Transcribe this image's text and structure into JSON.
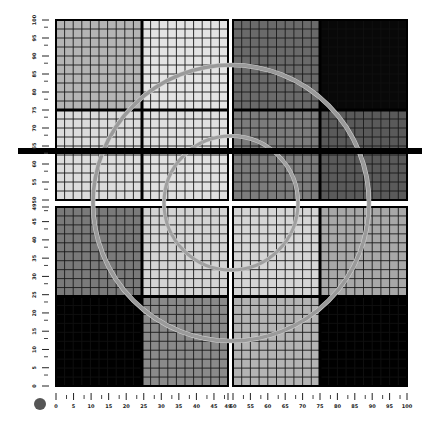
{
  "target": {
    "title": "",
    "plate": {
      "x0": 56,
      "y0": 20,
      "x1": 407,
      "y1": 386,
      "gap_x": [
        228,
        233
      ],
      "gap_y": [
        200,
        207
      ]
    },
    "quadrants": [
      {
        "name": "top-left",
        "cells": [
          {
            "name": "tl-a",
            "fill": "#b4b4b4"
          },
          {
            "name": "tl-b",
            "fill": "#e4e4e4"
          },
          {
            "name": "tl-c",
            "fill": "#dcdcdc"
          },
          {
            "name": "tl-d",
            "fill": "#e0e0e0"
          }
        ]
      },
      {
        "name": "top-right",
        "cells": [
          {
            "name": "tr-a",
            "fill": "#6a6a6a"
          },
          {
            "name": "tr-b",
            "fill": "#080808"
          },
          {
            "name": "tr-c",
            "fill": "#7c7c7c"
          },
          {
            "name": "tr-d",
            "fill": "#5a5a5a"
          }
        ]
      },
      {
        "name": "bottom-left",
        "cells": [
          {
            "name": "bl-a",
            "fill": "#7a7a7a"
          },
          {
            "name": "bl-b",
            "fill": "#d4d4d4"
          },
          {
            "name": "bl-c",
            "fill": "#000000"
          },
          {
            "name": "bl-d",
            "fill": "#8a8a8a"
          }
        ]
      },
      {
        "name": "bottom-right",
        "cells": [
          {
            "name": "br-a",
            "fill": "#d6d6d6"
          },
          {
            "name": "br-b",
            "fill": "#a8a8a8"
          },
          {
            "name": "br-c",
            "fill": "#b4b4b4"
          },
          {
            "name": "br-d",
            "fill": "#000000"
          }
        ]
      }
    ],
    "circles": [
      {
        "name": "outer-ring",
        "cx": 231,
        "cy": 203,
        "r": 138,
        "stroke": "#9a9a9a",
        "width": 3.5
      },
      {
        "name": "inner-ring",
        "cx": 231,
        "cy": 203,
        "r": 67,
        "stroke": "#a0a0a0",
        "width": 3
      }
    ],
    "bar": {
      "x0": 18,
      "x1": 422,
      "y": 151,
      "h": 6,
      "fill": "#000000"
    },
    "dot": {
      "cx": 40,
      "cy": 404,
      "r": 6,
      "fill": "#555555"
    }
  },
  "y_axis": {
    "labels": [
      "100",
      "95",
      "90",
      "85",
      "80",
      "75",
      "70",
      "65",
      "60",
      "55",
      "50",
      "49",
      "45",
      "40",
      "35",
      "30",
      "25",
      "20",
      "15",
      "10",
      "5",
      "0"
    ],
    "top_values": [
      100,
      95,
      90,
      85,
      80,
      75,
      70,
      65,
      60,
      55,
      50
    ],
    "bottom_values": [
      49,
      45,
      40,
      35,
      30,
      25,
      20,
      15,
      10,
      5,
      0
    ]
  },
  "x_axis": {
    "left_values": [
      0,
      5,
      10,
      15,
      20,
      25,
      30,
      35,
      40,
      45,
      49
    ],
    "right_values": [
      50,
      55,
      60,
      65,
      70,
      75,
      80,
      85,
      90,
      95,
      100
    ]
  }
}
